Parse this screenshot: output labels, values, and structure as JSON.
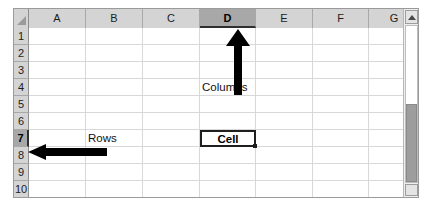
{
  "app": {
    "type": "spreadsheet",
    "title": "Spreadsheet grid"
  },
  "colors": {
    "header_fill": "#d4d4d4",
    "header_selected_fill": "#a8a8a8",
    "grid_line": "#d8d8d8",
    "cell_background": "#ffffff",
    "annotation": "#000000",
    "frame_border": "#9a9a9a",
    "scrollbar_thumb": "#9d9d9d"
  },
  "corner": {
    "icon": "select-all-triangle-icon"
  },
  "columns": {
    "headers": [
      "A",
      "B",
      "C",
      "D",
      "E",
      "F",
      "G"
    ],
    "selected": "D",
    "geometry": [
      {
        "label": "A",
        "left": 0,
        "width": 57
      },
      {
        "label": "B",
        "left": 57,
        "width": 57
      },
      {
        "label": "C",
        "left": 114,
        "width": 57
      },
      {
        "label": "D",
        "left": 171,
        "width": 56
      },
      {
        "label": "E",
        "left": 227,
        "width": 57
      },
      {
        "label": "F",
        "left": 284,
        "width": 56
      },
      {
        "label": "G",
        "left": 340,
        "width": 51
      }
    ]
  },
  "rows": {
    "headers": [
      "1",
      "2",
      "3",
      "4",
      "5",
      "6",
      "7",
      "8",
      "9",
      "10"
    ],
    "selected": "7",
    "row_height": 17
  },
  "cells": [
    {
      "ref": "D4",
      "value": "Columns",
      "col": 3,
      "row": 4
    },
    {
      "ref": "B7",
      "value": "Rows",
      "col": 1,
      "row": 7
    }
  ],
  "active_cell": {
    "ref": "D7",
    "value": "Cell",
    "col": 3,
    "row": 7,
    "fill_handle": true
  },
  "annotations": [
    {
      "name": "columns-arrow",
      "label": "Columns",
      "direction": "up",
      "points_to": "column-header-D"
    },
    {
      "name": "rows-arrow",
      "label": "Rows",
      "direction": "left",
      "points_to": "row-header-7"
    }
  ],
  "scrollbar": {
    "orientation": "vertical",
    "up_arrow": "scroll-up-arrow-icon",
    "down_arrow": "scroll-down-arrow-icon",
    "thumb_top_pct": 50,
    "thumb_height_pct": 50
  }
}
